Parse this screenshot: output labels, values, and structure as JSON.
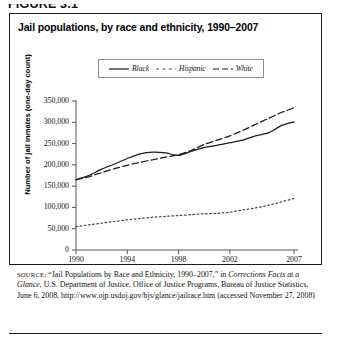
{
  "figure": {
    "number_label": "FIGURE 3.1"
  },
  "chart_title": "Jail populations, by race and ethnicity, 1990–2007",
  "legend": {
    "items": [
      {
        "label": "Black",
        "style": "solid"
      },
      {
        "label": "Hispanic",
        "style": "dotted"
      },
      {
        "label": "White",
        "style": "dashed"
      }
    ]
  },
  "axes": {
    "ylabel": "Number of jail inmates (one-day count)",
    "yticks": [
      "0",
      "50,000",
      "100,000",
      "150,000",
      "200,000",
      "250,000",
      "300,000",
      "350,000"
    ],
    "xticks": [
      "1990",
      "1994",
      "1998",
      "2002",
      "2007"
    ]
  },
  "source": {
    "lead": "SOURCE:",
    "text_1": " “Jail Populations by Race and Ethnicity, 1990–2007,” in ",
    "italic_1": "Corrections Facts at a Glance",
    "text_2": ", U.S. Department of Justice, Office of Justice Programs, Bureau of Justice Statistics, June 6, 2008, http://www.ojp.usdoj.gov/bjs/glance/jailrace.htm (accessed November 27, 2008)"
  },
  "chart_data": {
    "type": "line",
    "title": "Jail populations, by race and ethnicity, 1990–2007",
    "xlabel": "",
    "ylabel": "Number of jail inmates (one-day count)",
    "xlim": [
      1990,
      2007
    ],
    "ylim": [
      0,
      350000
    ],
    "ytick_values": [
      0,
      50000,
      100000,
      150000,
      200000,
      250000,
      300000,
      350000
    ],
    "xtick_values": [
      1990,
      1994,
      1998,
      2002,
      2007
    ],
    "grid": false,
    "legend_position": "top-center",
    "x": [
      1990,
      1991,
      1992,
      1993,
      1994,
      1995,
      1996,
      1997,
      1998,
      1999,
      2000,
      2001,
      2002,
      2003,
      2004,
      2005,
      2006,
      2007
    ],
    "series": [
      {
        "name": "Black",
        "style": "solid",
        "color": "#1a1a1a",
        "values": [
          165000,
          175000,
          190000,
          202000,
          215000,
          226000,
          230000,
          228000,
          222000,
          232000,
          241000,
          246000,
          252000,
          258000,
          268000,
          275000,
          292000,
          301000
        ]
      },
      {
        "name": "Hispanic",
        "style": "dotted",
        "color": "#4a4a4a",
        "values": [
          55000,
          59000,
          63000,
          67000,
          71000,
          74000,
          77000,
          79000,
          81000,
          83000,
          85000,
          86000,
          89000,
          94000,
          99000,
          105000,
          113000,
          121000
        ]
      },
      {
        "name": "White",
        "style": "dashed",
        "color": "#1a1a1a",
        "values": [
          165000,
          172000,
          182000,
          191000,
          199000,
          206000,
          212000,
          218000,
          224000,
          234000,
          248000,
          258000,
          268000,
          281000,
          295000,
          309000,
          323000,
          334000
        ]
      }
    ]
  }
}
